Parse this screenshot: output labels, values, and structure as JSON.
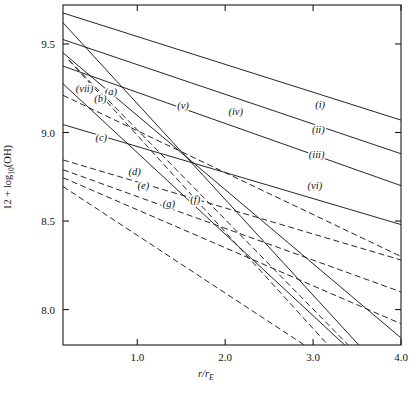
{
  "chart_data": {
    "type": "line",
    "title": "",
    "xlabel": "r/rE",
    "ylabel": "12 + log10(OH)",
    "xlim": [
      0.155,
      4.0
    ],
    "ylim": [
      7.8,
      9.72
    ],
    "grid": false,
    "legend_position": "inline-labels",
    "xticks": [
      1.0,
      2.0,
      3.0,
      4.0
    ],
    "xtick_labels": [
      "1.0",
      "2.0",
      "3.0",
      "4.0"
    ],
    "yticks": [
      8.0,
      8.5,
      9.0,
      9.5
    ],
    "ytick_labels": [
      "8.0",
      "8.5",
      "9.0",
      "9.5"
    ],
    "series": [
      {
        "name": "(i)",
        "style": "solid",
        "label_x": 3.08,
        "label_y": 9.14,
        "x": [
          0.155,
          4.0
        ],
        "y": [
          9.675,
          9.07
        ]
      },
      {
        "name": "(ii)",
        "style": "solid",
        "label_x": 3.06,
        "label_y": 9.0,
        "x": [
          0.155,
          4.0
        ],
        "y": [
          9.525,
          8.88
        ]
      },
      {
        "name": "(iii)",
        "style": "solid",
        "label_x": 3.04,
        "label_y": 8.855,
        "x": [
          0.155,
          4.0
        ],
        "y": [
          9.375,
          8.7
        ]
      },
      {
        "name": "(iv)",
        "style": "solid",
        "label_x": 2.12,
        "label_y": 9.1,
        "x": [
          0.155,
          4.0
        ],
        "y": [
          9.45,
          7.84
        ]
      },
      {
        "name": "(v)",
        "style": "solid",
        "label_x": 1.52,
        "label_y": 9.13,
        "x": [
          0.155,
          3.52
        ],
        "y": [
          9.62,
          7.8
        ]
      },
      {
        "name": "(vi)",
        "style": "solid",
        "label_x": 3.02,
        "label_y": 8.68,
        "x": [
          0.155,
          4.0
        ],
        "y": [
          9.045,
          8.48
        ]
      },
      {
        "name": "(vii)",
        "style": "solid",
        "label_x": 0.4,
        "label_y": 9.23,
        "x": [
          0.155,
          3.36
        ],
        "y": [
          9.275,
          7.8
        ]
      },
      {
        "name": "(a)",
        "style": "dashed",
        "label_x": 0.7,
        "label_y": 9.21,
        "x": [
          0.22,
          3.4
        ],
        "y": [
          9.41,
          7.8
        ]
      },
      {
        "name": "(b)",
        "style": "dashed",
        "label_x": 0.58,
        "label_y": 9.17,
        "x": [
          0.22,
          3.17
        ],
        "y": [
          9.41,
          7.8
        ]
      },
      {
        "name": "(c)",
        "style": "dashed",
        "label_x": 0.59,
        "label_y": 8.95,
        "x": [
          0.155,
          4.0
        ],
        "y": [
          9.21,
          8.3
        ]
      },
      {
        "name": "(d)",
        "style": "dashed",
        "label_x": 0.97,
        "label_y": 8.76,
        "x": [
          0.155,
          4.0
        ],
        "y": [
          8.845,
          8.28
        ]
      },
      {
        "name": "(e)",
        "style": "dashed",
        "label_x": 1.07,
        "label_y": 8.68,
        "x": [
          0.155,
          4.0
        ],
        "y": [
          8.79,
          8.1
        ]
      },
      {
        "name": "(f)",
        "style": "dashed",
        "label_x": 1.66,
        "label_y": 8.6,
        "x": [
          0.155,
          4.0
        ],
        "y": [
          8.745,
          7.92
        ]
      },
      {
        "name": "(g)",
        "style": "dashed",
        "label_x": 1.36,
        "label_y": 8.58,
        "x": [
          0.155,
          2.9
        ],
        "y": [
          8.695,
          7.8
        ]
      }
    ]
  }
}
